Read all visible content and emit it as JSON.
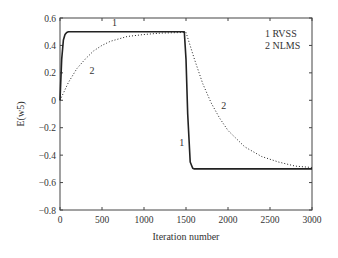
{
  "chart_data": {
    "type": "line",
    "title": "",
    "xlabel": "Iteration number",
    "ylabel": "E(w5)",
    "xlim": [
      0,
      3000
    ],
    "ylim": [
      -0.8,
      0.6
    ],
    "xticks": [
      0,
      500,
      1000,
      1500,
      2000,
      2500,
      3000
    ],
    "yticks": [
      0.6,
      0.4,
      0.2,
      0,
      -0.2,
      -0.4,
      -0.6,
      -0.8
    ],
    "xtick_labels": [
      "0",
      "500",
      "1000",
      "1500",
      "2000",
      "2500",
      "3000"
    ],
    "ytick_labels": [
      "0.6",
      "0.4",
      "0.2",
      "0",
      "−0.2",
      "−0.4",
      "−0.6",
      "−0.8"
    ],
    "grid": false,
    "legend_position": "upper right (inside)",
    "legend": [
      {
        "id": "1",
        "label": "RVSS",
        "style": "solid"
      },
      {
        "id": "2",
        "label": "NLMS",
        "style": "dotted"
      }
    ],
    "series": [
      {
        "name": "RVSS",
        "marker_label": "1",
        "style": "solid",
        "x": [
          0,
          20,
          40,
          60,
          80,
          100,
          150,
          500,
          1000,
          1480,
          1500,
          1520,
          1550,
          1580,
          1600,
          2000,
          2500,
          3000
        ],
        "y": [
          0.0,
          0.3,
          0.44,
          0.48,
          0.495,
          0.5,
          0.5,
          0.5,
          0.5,
          0.5,
          0.3,
          -0.1,
          -0.45,
          -0.495,
          -0.5,
          -0.5,
          -0.5,
          -0.5
        ]
      },
      {
        "name": "NLMS",
        "marker_label": "2",
        "style": "dotted",
        "x": [
          0,
          100,
          200,
          300,
          400,
          500,
          600,
          800,
          1000,
          1200,
          1500,
          1600,
          1700,
          1800,
          1900,
          2000,
          2200,
          2400,
          2600,
          2800,
          3000
        ],
        "y": [
          0.0,
          0.13,
          0.23,
          0.3,
          0.36,
          0.4,
          0.43,
          0.465,
          0.48,
          0.49,
          0.495,
          0.3,
          0.12,
          -0.02,
          -0.13,
          -0.22,
          -0.34,
          -0.41,
          -0.45,
          -0.48,
          -0.49
        ]
      }
    ],
    "annotations": [
      {
        "text": "1",
        "x": 650,
        "y": 0.54
      },
      {
        "text": "2",
        "x": 380,
        "y": 0.19
      },
      {
        "text": "1",
        "x": 1450,
        "y": -0.33
      },
      {
        "text": "2",
        "x": 1950,
        "y": -0.06
      }
    ]
  }
}
